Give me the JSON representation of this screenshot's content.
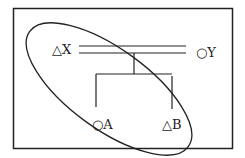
{
  "diagram": {
    "type": "genetic-pedigree",
    "nodes": [
      {
        "id": "X",
        "label": "X",
        "symbol": "△",
        "symbol_meaning": "triangle",
        "label_text": "△X"
      },
      {
        "id": "Y",
        "label": "Y",
        "symbol": "○",
        "symbol_meaning": "circle",
        "label_text": "○Y"
      },
      {
        "id": "A",
        "label": "A",
        "symbol": "○",
        "symbol_meaning": "circle",
        "label_text": "○A"
      },
      {
        "id": "B",
        "label": "B",
        "symbol": "△",
        "symbol_meaning": "triangle",
        "label_text": "△B"
      }
    ],
    "edges": [
      {
        "from": "X",
        "to": "Y",
        "kind": "double-line"
      },
      {
        "from": "X-Y",
        "to": [
          "A",
          "B"
        ],
        "kind": "children"
      }
    ],
    "grouping": {
      "shape": "ellipse",
      "encloses": [
        "X",
        "A",
        "B"
      ]
    },
    "colors": {
      "stroke": "#222222",
      "background": "#ffffff"
    }
  }
}
